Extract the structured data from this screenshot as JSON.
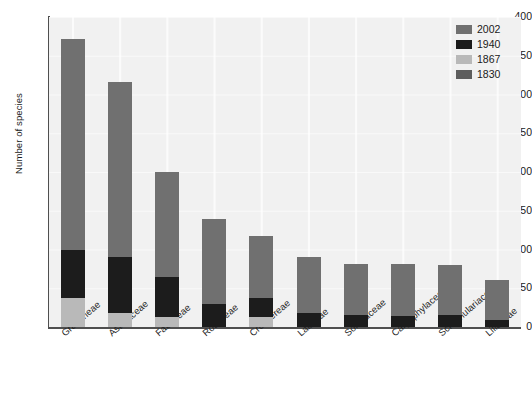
{
  "chart_data": {
    "type": "bar",
    "subtype": "stacked-bar",
    "title": "",
    "xlabel": "",
    "ylabel": "Number of species",
    "ylim": [
      0,
      400
    ],
    "yticks": [
      0,
      50,
      100,
      150,
      200,
      250,
      300,
      350,
      400
    ],
    "grid": true,
    "legend_position": "top-right",
    "categories": [
      "Gramineae",
      "Asteraceae",
      "Fabaceae",
      "Rosaceae",
      "Crucifereae",
      "Labiatae",
      "Solanaceae",
      "Caryophylaceae",
      "Scrophulariaceae",
      "Liliaceae"
    ],
    "series": [
      {
        "name": "1867",
        "color": "#b9b9b9",
        "values": [
          38,
          18,
          13,
          0,
          13,
          0,
          0,
          0,
          0,
          0
        ]
      },
      {
        "name": "1940",
        "color": "#1c1c1c",
        "values": [
          62,
          72,
          52,
          30,
          25,
          18,
          15,
          14,
          16,
          9
        ]
      },
      {
        "name": "2002",
        "color": "#707070",
        "values": [
          272,
          226,
          135,
          110,
          79,
          72,
          66,
          67,
          64,
          52
        ]
      }
    ],
    "totals": [
      372,
      316,
      200,
      140,
      117,
      90,
      81,
      81,
      80,
      61
    ],
    "legend": [
      {
        "label": "2002",
        "color": "#707070"
      },
      {
        "label": "1940",
        "color": "#1c1c1c"
      },
      {
        "label": "1867",
        "color": "#b9b9b9"
      },
      {
        "label": "1830",
        "color": "#5e5e5e"
      }
    ],
    "colors": {
      "plot_background": "#f1f1f1",
      "axis": "#4f4f4f",
      "gridline": "#ffffff",
      "text": "#1a1a1a"
    }
  }
}
